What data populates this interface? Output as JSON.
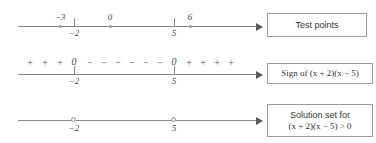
{
  "figure": {
    "line_color": "#8a8a8a",
    "text_color": "#3f3f3f",
    "box_border_color": "#9d9d9d"
  },
  "rows": [
    {
      "id": "test-points",
      "ticks": [
        {
          "value": "-2",
          "label": "−2",
          "x": 74
        },
        {
          "value": "5",
          "label": "5",
          "x": 174
        }
      ],
      "points": [
        {
          "value": "-3",
          "label": "−3",
          "x": 60
        },
        {
          "value": "0",
          "label": "0",
          "x": 110
        },
        {
          "value": "6",
          "label": "6",
          "x": 190
        }
      ],
      "callout": {
        "lines": [
          "Test points"
        ],
        "kind": "plain"
      }
    },
    {
      "id": "sign-row",
      "ticks": [
        {
          "value": "-2",
          "label": "−2",
          "x": 74
        },
        {
          "value": "5",
          "label": "5",
          "x": 174
        }
      ],
      "signs": [
        {
          "symbol": "+",
          "x": 30
        },
        {
          "symbol": "+",
          "x": 45
        },
        {
          "symbol": "+",
          "x": 60
        },
        {
          "symbol": "0",
          "x": 74
        },
        {
          "symbol": "−",
          "x": 90
        },
        {
          "symbol": "−",
          "x": 104
        },
        {
          "symbol": "−",
          "x": 118
        },
        {
          "symbol": "−",
          "x": 132
        },
        {
          "symbol": "−",
          "x": 146
        },
        {
          "symbol": "−",
          "x": 160
        },
        {
          "symbol": "0",
          "x": 174
        },
        {
          "symbol": "+",
          "x": 189
        },
        {
          "symbol": "+",
          "x": 203
        },
        {
          "symbol": "+",
          "x": 217
        },
        {
          "symbol": "+",
          "x": 231
        }
      ],
      "callout": {
        "lines": [
          "Sign of (x + 2)(x − 5)"
        ],
        "kind": "math"
      }
    },
    {
      "id": "solution-set",
      "open_circles": [
        {
          "value": "-2",
          "label": "−2",
          "x": 74
        },
        {
          "value": "5",
          "label": "5",
          "x": 174
        }
      ],
      "callout": {
        "lines": [
          "Solution set for",
          "(x + 2)(x − 5) > 0"
        ],
        "kind": "mixed"
      }
    }
  ]
}
